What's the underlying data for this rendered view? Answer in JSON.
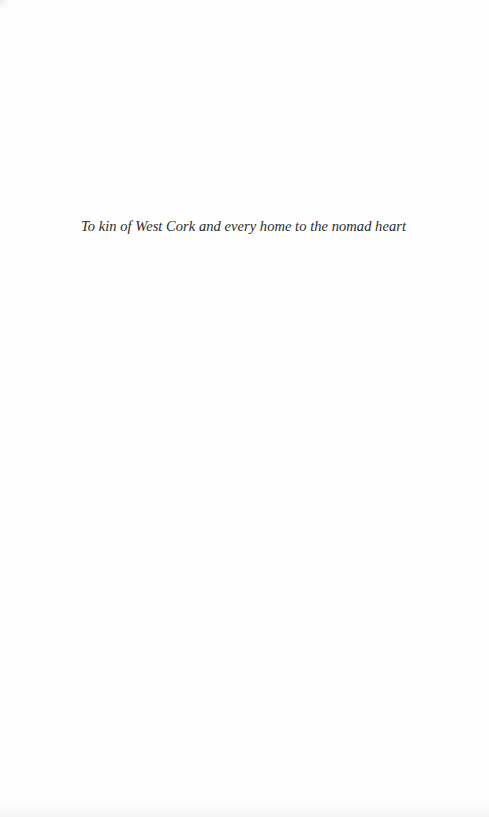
{
  "page": {
    "type": "dedication",
    "dedication_text": "To kin of West Cork and every home to the nomad heart"
  },
  "colors": {
    "background": "#fefefe",
    "text": "#2a2a2a"
  }
}
